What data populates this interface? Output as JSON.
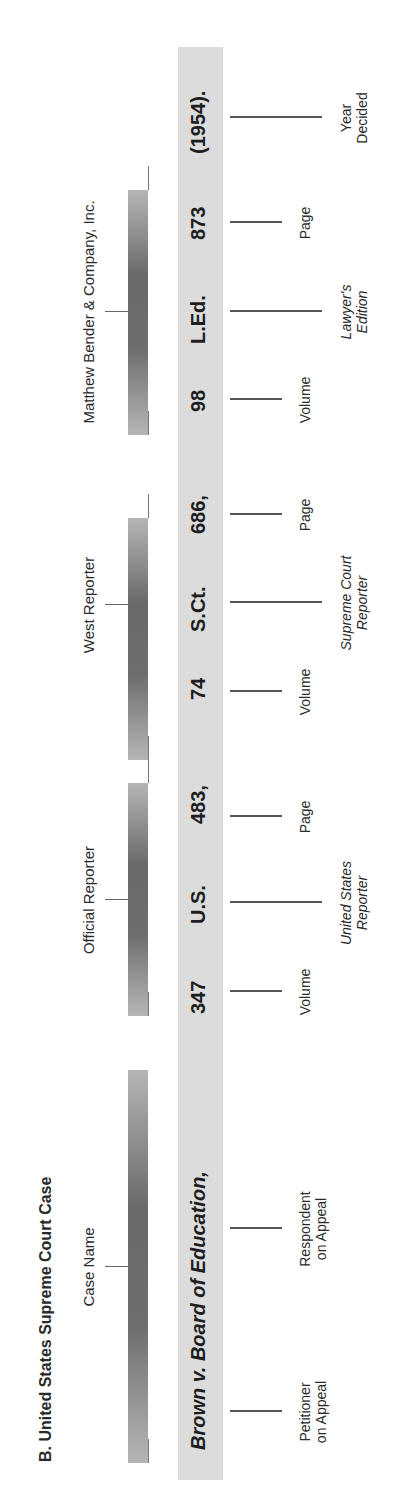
{
  "title": "B.  United States Supreme Court Case",
  "groups": {
    "case_name": "Case Name",
    "official": "Official Reporter",
    "west": "West Reporter",
    "bender": "Matthew Bender & Company, Inc."
  },
  "citation": {
    "case": "Brown v. Board of Education,",
    "us_volume": "347",
    "us_reporter": "U.S.",
    "us_page": "483,",
    "sct_volume": "74",
    "sct_reporter": "S.Ct.",
    "sct_page": "686,",
    "led_volume": "98",
    "led_reporter": "L.Ed.",
    "led_page": "873",
    "year": "(1954)."
  },
  "labels": {
    "petitioner_1": "Petitioner",
    "petitioner_2": "on Appeal",
    "respondent_1": "Respondent",
    "respondent_2": "on Appeal",
    "volume": "Volume",
    "page": "Page",
    "us_rep_1": "United States",
    "us_rep_2": "Reporter",
    "sct_rep_1": "Supreme Court",
    "sct_rep_2": "Reporter",
    "led_rep_1": "Lawyer's",
    "led_rep_2": "Edition",
    "year_1": "Year",
    "year_2": "Decided"
  },
  "colors": {
    "band": "#dcdcdc",
    "bar_dark": "#6a6a6a",
    "bar_light": "#b5b5b5",
    "text": "#2a2a2a"
  }
}
